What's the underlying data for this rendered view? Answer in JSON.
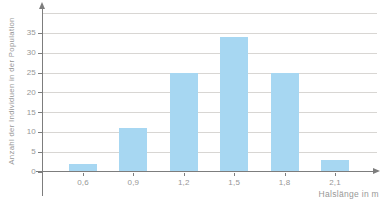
{
  "chart_data": {
    "type": "bar",
    "title": "",
    "categories": [
      "0,6",
      "0,9",
      "1,2",
      "1,5",
      "1,8",
      "2,1"
    ],
    "values": [
      2,
      11,
      25,
      34,
      25,
      3
    ],
    "xlabel": "Halslänge in m",
    "ylabel": "Anzahl der Individuen in der Population",
    "ylim": [
      0,
      40
    ],
    "yticks": [
      0,
      5,
      10,
      15,
      20,
      25,
      30,
      35
    ],
    "grid": true,
    "legend": "none",
    "colors": {
      "bar": "#a7d7f2",
      "gridline": "#d8d6d3",
      "axis": "#7d7d7d",
      "text": "#979797",
      "background": "#ffffff"
    }
  }
}
